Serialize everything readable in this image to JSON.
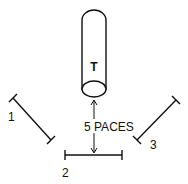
{
  "diagram": {
    "target": {
      "label": "T"
    },
    "distance": {
      "label": "5 PACES"
    },
    "positions": [
      {
        "id": "1",
        "label": "1"
      },
      {
        "id": "2",
        "label": "2"
      },
      {
        "id": "3",
        "label": "3"
      }
    ]
  },
  "colors": {
    "ink": "#111111",
    "background": "#ffffff"
  }
}
